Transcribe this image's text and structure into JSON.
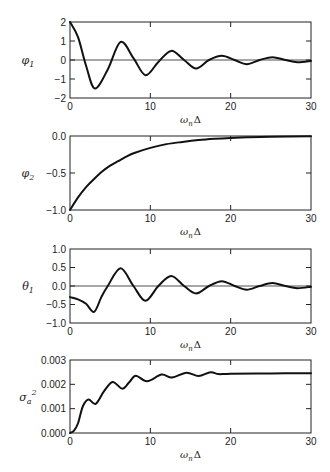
{
  "chart_data": [
    {
      "type": "line",
      "title": "",
      "ylabel": "φ1",
      "xlabel": "ωnΔ",
      "xlim": [
        0,
        30
      ],
      "ylim": [
        -2,
        2
      ],
      "xticks": [
        0,
        10,
        20,
        30
      ],
      "yticks": [
        -2,
        -1,
        0,
        1,
        2
      ],
      "ytick_labels": [
        "−2",
        "−1",
        "0",
        "1",
        "2"
      ],
      "zero_line": true,
      "grid": false,
      "x": [
        0,
        1,
        2,
        3.1,
        4.7,
        6.3,
        7.9,
        9.4,
        11,
        12.6,
        14.2,
        15.7,
        17.3,
        18.9,
        20.5,
        22,
        23.6,
        25.2,
        26.8,
        28.3,
        30
      ],
      "y": [
        2.0,
        1.2,
        -0.3,
        -1.5,
        -0.5,
        0.95,
        0.1,
        -0.8,
        -0.1,
        0.48,
        0.0,
        -0.45,
        0.0,
        0.22,
        0.0,
        -0.22,
        0.0,
        0.15,
        0.0,
        -0.12,
        -0.05
      ]
    },
    {
      "type": "line",
      "title": "",
      "ylabel": "φ2",
      "xlabel": "ωnΔ",
      "xlim": [
        0,
        30
      ],
      "ylim": [
        -1.0,
        0.0
      ],
      "xticks": [
        0,
        10,
        20,
        30
      ],
      "yticks": [
        -1.0,
        -0.5,
        0.0
      ],
      "ytick_labels": [
        "−1.0",
        "−0.5",
        "0.0"
      ],
      "zero_line": false,
      "grid": false,
      "x": [
        0,
        1,
        2,
        3,
        4,
        5,
        6,
        7,
        8,
        10,
        12,
        14,
        16,
        18,
        20,
        22,
        25,
        30
      ],
      "y": [
        -1.0,
        -0.83,
        -0.69,
        -0.58,
        -0.48,
        -0.4,
        -0.34,
        -0.28,
        -0.23,
        -0.16,
        -0.11,
        -0.08,
        -0.055,
        -0.038,
        -0.026,
        -0.018,
        -0.01,
        -0.004
      ]
    },
    {
      "type": "line",
      "title": "",
      "ylabel": "θ1",
      "xlabel": "ωnΔ",
      "xlim": [
        0,
        30
      ],
      "ylim": [
        -1.0,
        1.0
      ],
      "xticks": [
        0,
        10,
        20,
        30
      ],
      "yticks": [
        -1.0,
        -0.5,
        0.0,
        0.5,
        1.0
      ],
      "ytick_labels": [
        "−1.0",
        "−0.5",
        "0.0",
        "0.5",
        "1.0"
      ],
      "zero_line": true,
      "grid": false,
      "x": [
        0,
        1,
        2,
        3,
        3.9,
        4.7,
        6.3,
        7.9,
        9.4,
        11,
        12.6,
        14.2,
        15.7,
        17.3,
        18.9,
        20.5,
        22,
        23.6,
        25.2,
        26.8,
        28.3,
        30
      ],
      "y": [
        -0.3,
        -0.36,
        -0.48,
        -0.7,
        -0.3,
        0.0,
        0.48,
        0.0,
        -0.4,
        0.0,
        0.27,
        0.0,
        -0.2,
        0.0,
        0.13,
        0.0,
        -0.1,
        0.0,
        0.08,
        0.0,
        -0.06,
        -0.02
      ]
    },
    {
      "type": "line",
      "title": "",
      "ylabel": "σa²",
      "xlabel": "ωnΔ",
      "xlim": [
        0,
        30
      ],
      "ylim": [
        0.0,
        0.003
      ],
      "xticks": [
        0,
        10,
        20,
        30
      ],
      "yticks": [
        0.0,
        0.001,
        0.002,
        0.003
      ],
      "ytick_labels": [
        "0.000",
        "0.001",
        "0.002",
        "0.003"
      ],
      "zero_line": false,
      "grid": false,
      "x": [
        0,
        0.5,
        1.0,
        1.6,
        2.3,
        3.2,
        4.2,
        5.3,
        6.5,
        7.4,
        8.2,
        9.6,
        11.4,
        12.7,
        14.5,
        16.0,
        17.5,
        18.5,
        20,
        25,
        30
      ],
      "y": [
        0.0,
        0.0001,
        0.0004,
        0.0011,
        0.00138,
        0.0012,
        0.0017,
        0.0021,
        0.00182,
        0.0021,
        0.00235,
        0.00213,
        0.0024,
        0.00228,
        0.00248,
        0.00234,
        0.0025,
        0.00242,
        0.00244,
        0.00245,
        0.00246
      ]
    }
  ],
  "panels": [
    {
      "frame": {
        "left": 70,
        "top": 22,
        "right": 311,
        "bottom": 98
      }
    },
    {
      "frame": {
        "left": 70,
        "top": 136,
        "right": 311,
        "bottom": 210
      }
    },
    {
      "frame": {
        "left": 70,
        "top": 249,
        "right": 311,
        "bottom": 323
      }
    },
    {
      "frame": {
        "left": 70,
        "top": 360,
        "right": 311,
        "bottom": 433
      }
    }
  ]
}
